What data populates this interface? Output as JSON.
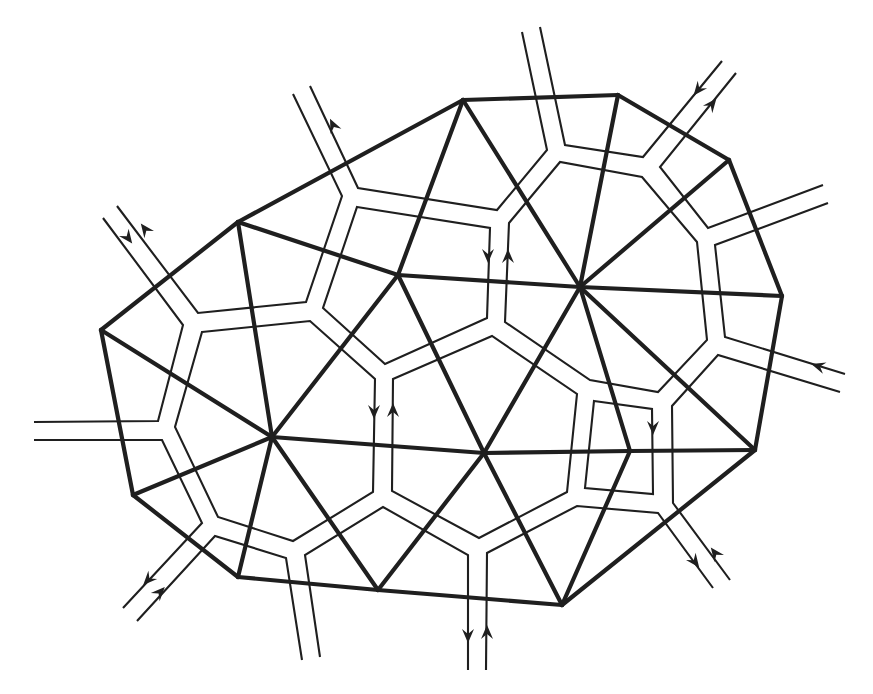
{
  "diagram": {
    "colors": {
      "stroke": "#1f1f1f",
      "background": "#ffffff"
    },
    "vertices": {
      "A": [
        463,
        100
      ],
      "B": [
        618,
        95
      ],
      "C": [
        729,
        160
      ],
      "D": [
        782,
        296
      ],
      "E": [
        755,
        450
      ],
      "F": [
        562,
        605
      ],
      "G": [
        378,
        590
      ],
      "H": [
        238,
        577
      ],
      "I": [
        133,
        495
      ],
      "J": [
        101,
        330
      ],
      "K": [
        238,
        222
      ],
      "L": [
        398,
        275
      ],
      "M": [
        580,
        287
      ],
      "N": [
        272,
        437
      ],
      "O": [
        484,
        453
      ],
      "P": [
        630,
        451
      ]
    },
    "thick_edges": [
      [
        "A",
        "B"
      ],
      [
        "B",
        "C"
      ],
      [
        "C",
        "D"
      ],
      [
        "D",
        "E"
      ],
      [
        "E",
        "F"
      ],
      [
        "F",
        "G"
      ],
      [
        "G",
        "H"
      ],
      [
        "H",
        "I"
      ],
      [
        "I",
        "J"
      ],
      [
        "J",
        "K"
      ],
      [
        "K",
        "A"
      ],
      [
        "K",
        "L"
      ],
      [
        "L",
        "A"
      ],
      [
        "A",
        "M"
      ],
      [
        "M",
        "B"
      ],
      [
        "M",
        "C"
      ],
      [
        "M",
        "D"
      ],
      [
        "L",
        "M"
      ],
      [
        "L",
        "N"
      ],
      [
        "L",
        "O"
      ],
      [
        "M",
        "O"
      ],
      [
        "M",
        "P"
      ],
      [
        "M",
        "E"
      ],
      [
        "P",
        "E"
      ],
      [
        "O",
        "P"
      ],
      [
        "N",
        "O"
      ],
      [
        "N",
        "J"
      ],
      [
        "N",
        "I"
      ],
      [
        "N",
        "H"
      ],
      [
        "N",
        "G"
      ],
      [
        "K",
        "N"
      ],
      [
        "O",
        "G"
      ],
      [
        "O",
        "F"
      ],
      [
        "P",
        "F"
      ]
    ],
    "thin_paths": [
      {
        "id": "stub-tl-outer",
        "closed": false,
        "points": [
          [
            103,
            218
          ],
          [
            183,
            325
          ],
          [
            158,
            421
          ],
          [
            34,
            422
          ]
        ]
      },
      {
        "id": "stub-tl-inner",
        "closed": false,
        "points": [
          [
            117,
            206
          ],
          [
            198,
            313
          ],
          [
            306,
            302
          ],
          [
            342,
            196
          ],
          [
            293,
            94
          ]
        ]
      },
      {
        "id": "stub-top-left",
        "closed": false,
        "points": [
          [
            310,
            86
          ],
          [
            358,
            188
          ],
          [
            497,
            210
          ],
          [
            547,
            150
          ],
          [
            522,
            32
          ]
        ]
      },
      {
        "id": "stub-top-right",
        "closed": false,
        "points": [
          [
            540,
            27
          ],
          [
            565,
            145
          ],
          [
            643,
            157
          ],
          [
            722,
            61
          ]
        ]
      },
      {
        "id": "stub-ne",
        "closed": false,
        "points": [
          [
            736,
            73
          ],
          [
            660,
            167
          ],
          [
            708,
            228
          ],
          [
            823,
            185
          ]
        ]
      },
      {
        "id": "stub-east-upper",
        "closed": false,
        "points": [
          [
            828,
            203
          ],
          [
            715,
            245
          ],
          [
            725,
            337
          ],
          [
            845,
            374
          ]
        ]
      },
      {
        "id": "stub-east-lower",
        "closed": false,
        "points": [
          [
            840,
            392
          ],
          [
            718,
            355
          ],
          [
            672,
            406
          ],
          [
            673,
            503
          ],
          [
            730,
            580
          ]
        ]
      },
      {
        "id": "stub-se",
        "closed": false,
        "points": [
          [
            713,
            588
          ],
          [
            658,
            513
          ],
          [
            577,
            506
          ],
          [
            487,
            553
          ],
          [
            486,
            670
          ]
        ]
      },
      {
        "id": "stub-south",
        "closed": false,
        "points": [
          [
            468,
            670
          ],
          [
            468,
            555
          ],
          [
            383,
            507
          ],
          [
            305,
            555
          ],
          [
            320,
            657
          ]
        ]
      },
      {
        "id": "stub-sw",
        "closed": false,
        "points": [
          [
            302,
            660
          ],
          [
            286,
            558
          ],
          [
            215,
            536
          ],
          [
            137,
            621
          ]
        ]
      },
      {
        "id": "stub-west",
        "closed": false,
        "points": [
          [
            34,
            440
          ],
          [
            162,
            440
          ],
          [
            202,
            523
          ],
          [
            123,
            608
          ]
        ]
      },
      {
        "id": "loop-n",
        "closed": true,
        "points": [
          [
            202,
            332
          ],
          [
            310,
            321
          ],
          [
            375,
            379
          ],
          [
            373,
            492
          ],
          [
            293,
            541
          ],
          [
            218,
            517
          ],
          [
            175,
            427
          ]
        ]
      },
      {
        "id": "loop-l",
        "closed": true,
        "points": [
          [
            357,
            207
          ],
          [
            490,
            228
          ],
          [
            487,
            318
          ],
          [
            385,
            364
          ],
          [
            323,
            308
          ]
        ]
      },
      {
        "id": "loop-o",
        "closed": true,
        "points": [
          [
            393,
            379
          ],
          [
            492,
            336
          ],
          [
            577,
            394
          ],
          [
            567,
            492
          ],
          [
            479,
            538
          ],
          [
            392,
            491
          ]
        ]
      },
      {
        "id": "loop-m",
        "closed": true,
        "points": [
          [
            509,
            223
          ],
          [
            560,
            162
          ],
          [
            642,
            177
          ],
          [
            697,
            242
          ],
          [
            707,
            340
          ],
          [
            658,
            392
          ],
          [
            590,
            380
          ],
          [
            505,
            322
          ]
        ]
      },
      {
        "id": "loop-p",
        "closed": true,
        "points": [
          [
            594,
            401
          ],
          [
            652,
            409
          ],
          [
            653,
            494
          ],
          [
            585,
            488
          ]
        ]
      }
    ],
    "arrows": [
      {
        "name": "arrow-tl-in",
        "at": [
          128,
          238
        ],
        "dir": [
          0.6,
          0.8
        ]
      },
      {
        "name": "arrow-tl-out",
        "at": [
          145,
          229
        ],
        "dir": [
          -0.6,
          -0.8
        ]
      },
      {
        "name": "arrow-top-left-out",
        "at": [
          333,
          125
        ],
        "dir": [
          -0.43,
          -0.9
        ]
      },
      {
        "name": "arrow-ne-in",
        "at": [
          698,
          90
        ],
        "dir": [
          -0.62,
          0.78
        ]
      },
      {
        "name": "arrow-ne-out",
        "at": [
          712,
          104
        ],
        "dir": [
          0.62,
          -0.78
        ]
      },
      {
        "name": "arrow-l-down",
        "at": [
          488,
          256
        ],
        "dir": [
          0,
          1
        ]
      },
      {
        "name": "arrow-m-up",
        "at": [
          508,
          256
        ],
        "dir": [
          0,
          -1
        ]
      },
      {
        "name": "arrow-n-down",
        "at": [
          374,
          412
        ],
        "dir": [
          0,
          1
        ]
      },
      {
        "name": "arrow-o-up",
        "at": [
          393,
          410
        ],
        "dir": [
          0,
          -1
        ]
      },
      {
        "name": "arrow-east-in",
        "at": [
          818,
          366
        ],
        "dir": [
          -0.95,
          -0.3
        ]
      },
      {
        "name": "arrow-p-down",
        "at": [
          653,
          428
        ],
        "dir": [
          0,
          1
        ]
      },
      {
        "name": "arrow-se-out",
        "at": [
          695,
          562
        ],
        "dir": [
          0.6,
          0.8
        ]
      },
      {
        "name": "arrow-se-in",
        "at": [
          715,
          553
        ],
        "dir": [
          -0.6,
          -0.8
        ]
      },
      {
        "name": "arrow-s-out",
        "at": [
          468,
          636
        ],
        "dir": [
          0,
          1
        ]
      },
      {
        "name": "arrow-s-in",
        "at": [
          487,
          632
        ],
        "dir": [
          0,
          -1
        ]
      },
      {
        "name": "arrow-sw-out",
        "at": [
          148,
          580
        ],
        "dir": [
          -0.68,
          0.73
        ]
      },
      {
        "name": "arrow-sw-in",
        "at": [
          160,
          592
        ],
        "dir": [
          0.68,
          -0.73
        ]
      }
    ]
  }
}
